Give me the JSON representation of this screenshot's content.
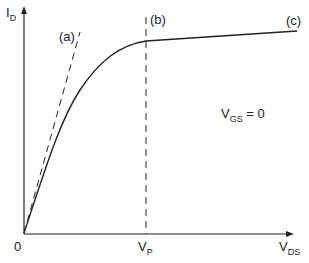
{
  "axes": {
    "y_label": {
      "main": "I",
      "sub": "D"
    },
    "x_label": {
      "main": "V",
      "sub": "DS"
    },
    "origin_label": "0"
  },
  "markers": {
    "vp_label": {
      "main": "V",
      "sub": "P"
    }
  },
  "curve_labels": {
    "a": "(a)",
    "b": "(b)",
    "c": "(c)"
  },
  "annotation": {
    "main": "V",
    "sub": "GS",
    "rest": " = 0"
  },
  "colors": {
    "ink": "#222222",
    "background": "#ffffff"
  }
}
